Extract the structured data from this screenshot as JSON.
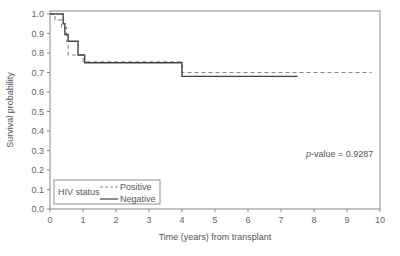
{
  "chart_data": {
    "type": "line",
    "subtype": "kaplan-meier step",
    "title": "",
    "xlabel": "Time (years) from transplant",
    "ylabel": "Survival probability",
    "xlim": [
      0,
      10
    ],
    "ylim": [
      0.0,
      1.0
    ],
    "x_ticks": [
      "0",
      "1",
      "2",
      "3",
      "4",
      "5",
      "6",
      "7",
      "8",
      "9",
      "10"
    ],
    "y_ticks": [
      "0.0",
      "0.1",
      "0.2",
      "0.3",
      "0.4",
      "0.5",
      "0.6",
      "0.7",
      "0.8",
      "0.9",
      "1.0"
    ],
    "grid": false,
    "legend": {
      "title": "HIV status",
      "position": "lower left",
      "entries": [
        {
          "label": "Positive",
          "style": "dashed"
        },
        {
          "label": "Negative",
          "style": "solid"
        }
      ]
    },
    "annotation": {
      "italic_prefix": "p",
      "text": "-value = 0.9287"
    },
    "series": [
      {
        "name": "Positive",
        "style": "dashed",
        "color": "#888888",
        "steps": [
          {
            "x": 0.0,
            "y": 1.0
          },
          {
            "x": 0.15,
            "y": 0.97
          },
          {
            "x": 0.35,
            "y": 0.93
          },
          {
            "x": 0.5,
            "y": 0.86
          },
          {
            "x": 0.55,
            "y": 0.79
          },
          {
            "x": 1.0,
            "y": 0.755
          },
          {
            "x": 4.0,
            "y": 0.7
          }
        ],
        "end_x": 9.75
      },
      {
        "name": "Negative",
        "style": "solid",
        "color": "#444444",
        "steps": [
          {
            "x": 0.0,
            "y": 1.0
          },
          {
            "x": 0.4,
            "y": 0.95
          },
          {
            "x": 0.45,
            "y": 0.895
          },
          {
            "x": 0.55,
            "y": 0.86
          },
          {
            "x": 0.85,
            "y": 0.79
          },
          {
            "x": 1.05,
            "y": 0.75
          },
          {
            "x": 4.0,
            "y": 0.68
          }
        ],
        "end_x": 7.5
      }
    ]
  }
}
